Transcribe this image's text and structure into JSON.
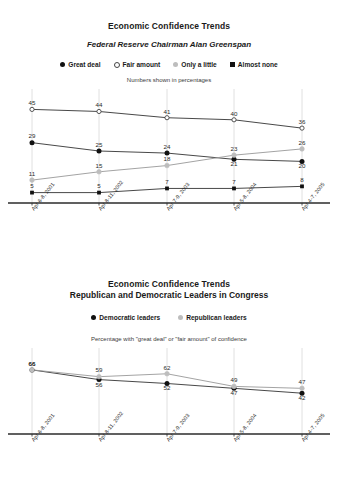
{
  "chart_data": [
    {
      "type": "line",
      "title": "Economic Confidence Trends",
      "subtitle": "Federal Reserve Chairman Alan Greenspan",
      "note": "Numbers shown in percentages",
      "xlabel": "",
      "ylabel": "",
      "ylim": [
        0,
        50
      ],
      "grid": "vertical",
      "legend_position": "top",
      "categories": [
        "Apr 6-8, 2001",
        "Apr 8-11, 2002",
        "Apr 7-9, 2003",
        "Apr 5-8, 2004",
        "Apr 4-7, 2005"
      ],
      "series": [
        {
          "name": "Great deal",
          "marker": "filled-circle",
          "color": "#111111",
          "values": [
            29,
            25,
            24,
            21,
            20
          ]
        },
        {
          "name": "Fair amount",
          "marker": "open-circle",
          "color": "#444444",
          "values": [
            45,
            44,
            41,
            40,
            36
          ]
        },
        {
          "name": "Only a little",
          "marker": "gray-circle",
          "color": "#bdbdbd",
          "values": [
            11,
            15,
            18,
            23,
            26
          ]
        },
        {
          "name": "Almost none",
          "marker": "black-square",
          "color": "#111111",
          "values": [
            5,
            5,
            7,
            7,
            8
          ]
        }
      ]
    },
    {
      "type": "line",
      "title": "Economic Confidence Trends",
      "subtitle": "Republican and Democratic Leaders in Congress",
      "note": "Percentage with \"great deal\" or \"fair amount\" of confidence",
      "xlabel": "",
      "ylabel": "",
      "ylim": [
        0,
        70
      ],
      "grid": "vertical",
      "legend_position": "top",
      "categories": [
        "Apr 6-8, 2001",
        "Apr 8-11, 2002",
        "Apr 7-9, 2003",
        "Apr 5-8, 2004",
        "Apr 4-7, 2005"
      ],
      "series": [
        {
          "name": "Democratic leaders",
          "marker": "filled-circle",
          "color": "#111111",
          "values": [
            66,
            56,
            52,
            47,
            42
          ]
        },
        {
          "name": "Republican leaders",
          "marker": "gray-circle",
          "color": "#bdbdbd",
          "values": [
            66,
            59,
            62,
            49,
            47
          ]
        }
      ]
    }
  ],
  "panel1": {
    "title": "Economic Confidence Trends",
    "subtitle": "Federal Reserve Chairman Alan Greenspan",
    "note": "Numbers shown in percentages",
    "legend": [
      {
        "label": "Great deal",
        "marker": "filled-circle"
      },
      {
        "label": "Fair amount",
        "marker": "open-circle"
      },
      {
        "label": "Only a little",
        "marker": "gray-circle"
      },
      {
        "label": "Almost none",
        "marker": "black-square"
      }
    ]
  },
  "panel2": {
    "title": "Economic Confidence Trends",
    "subtitle": "Republican and Democratic Leaders in Congress",
    "note": "Percentage with \"great deal\" or \"fair amount\" of confidence",
    "legend": [
      {
        "label": "Democratic leaders",
        "marker": "filled-circle"
      },
      {
        "label": "Republican leaders",
        "marker": "gray-circle"
      }
    ]
  }
}
